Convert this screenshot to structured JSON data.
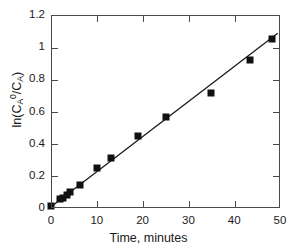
{
  "chart_data": {
    "type": "scatter",
    "title": "",
    "subtitle": "",
    "xlabel": "Time, minutes",
    "ylabel_parts": {
      "prefix": "ln(C",
      "sub1": "A",
      "sup1": "0",
      "middle": "/C",
      "sub2": "A",
      "suffix": ")"
    },
    "ylabel": "ln(C_A^0/C_A)",
    "xlim": [
      0,
      50
    ],
    "ylim": [
      0,
      1.2
    ],
    "xticks": [
      0,
      10,
      20,
      30,
      40,
      50
    ],
    "xtick_labels": [
      "0",
      "10",
      "20",
      "30",
      "40",
      "50"
    ],
    "yticks": [
      0,
      0.2,
      0.4,
      0.6,
      0.8,
      1.0,
      1.2
    ],
    "ytick_labels": [
      "0",
      "0.2",
      "0.4",
      "0.6",
      "0.8",
      "1",
      "1.2"
    ],
    "grid": false,
    "legend": false,
    "marker_style": "filled-square",
    "marker_color": "#111111",
    "line_color": "#1a1a1a",
    "frame_color": "#4a4a4a",
    "x": [
      0.0,
      2.0,
      2.6,
      3.5,
      4.1,
      6.3,
      10.0,
      13.0,
      19.0,
      25.2,
      34.9,
      43.4,
      48.3
    ],
    "y": [
      0.012,
      0.055,
      0.065,
      0.082,
      0.097,
      0.141,
      0.25,
      0.312,
      0.445,
      0.565,
      0.712,
      0.918,
      1.048
    ],
    "series": [
      {
        "name": "data",
        "points": [
          [
            0.0,
            0.012
          ],
          [
            2.0,
            0.055
          ],
          [
            2.6,
            0.065
          ],
          [
            3.5,
            0.082
          ],
          [
            4.1,
            0.097
          ],
          [
            6.3,
            0.141
          ],
          [
            10.0,
            0.25
          ],
          [
            13.0,
            0.312
          ],
          [
            19.0,
            0.445
          ],
          [
            25.2,
            0.565
          ],
          [
            34.9,
            0.712
          ],
          [
            43.4,
            0.918
          ],
          [
            48.3,
            1.048
          ]
        ]
      }
    ],
    "fit_line": {
      "type": "linear",
      "slope": 0.0218,
      "intercept": 0.008,
      "x_start": 0.0,
      "x_end": 49.5,
      "y_start": 0.008,
      "y_end": 1.087
    }
  }
}
